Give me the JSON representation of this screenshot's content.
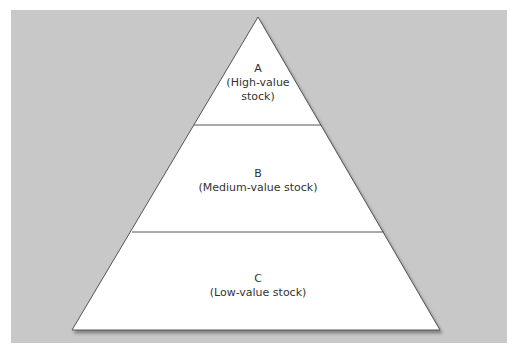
{
  "diagram": {
    "type": "pyramid",
    "background_color": "#c8c8c8",
    "fill_color": "#ffffff",
    "levels": [
      {
        "letter": "A",
        "description": "(High-value stock)",
        "line1": "(High-value",
        "line2": "stock)"
      },
      {
        "letter": "B",
        "description": "(Medium-value stock)"
      },
      {
        "letter": "C",
        "description": "(Low-value stock)"
      }
    ]
  }
}
